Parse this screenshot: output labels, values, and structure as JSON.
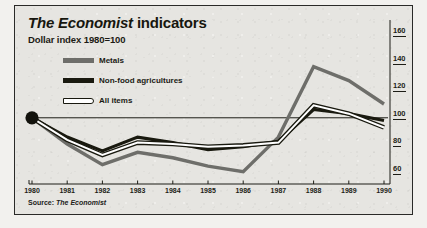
{
  "figure": {
    "title_brand": "The Economist",
    "title_rest": " indicators",
    "subtitle": "Dollar index 1980=100",
    "source_prefix": "Source: ",
    "source_brand": "The Economist"
  },
  "legend": {
    "position": "inside-top-left",
    "entries": [
      {
        "label": "Metals",
        "color": "#6e6e6a",
        "style": "solid-thick"
      },
      {
        "label": "Non-food agricultures",
        "color": "#19190f",
        "style": "solid-thick"
      },
      {
        "label": "All items",
        "color": "#ffffff",
        "style": "outlined"
      }
    ]
  },
  "colors": {
    "panel_background": "#e6e5e1",
    "panel_border": "#2a2a28",
    "metals": "#6e6e6a",
    "nonfood": "#19190f",
    "allitems_fill": "#ffffff",
    "allitems_stroke": "#19190f",
    "axis": "#1d1d16",
    "marker": "#12120c"
  },
  "chart_data": {
    "type": "line",
    "title": "The Economist indicators",
    "subtitle": "Dollar index 1980=100",
    "xlabel": "",
    "ylabel": "",
    "x": [
      1980,
      1981,
      1982,
      1983,
      1984,
      1985,
      1986,
      1987,
      1988,
      1989,
      1990
    ],
    "xticklabels": [
      "1980",
      "1981",
      "1982",
      "1983",
      "1984",
      "1985",
      "1986",
      "1987",
      "1988",
      "1989",
      "1990"
    ],
    "yticks": [
      60,
      80,
      100,
      120,
      140,
      160
    ],
    "yticklabels": [
      "60",
      "80",
      "100",
      "120",
      "140",
      "160"
    ],
    "ylim": [
      52,
      168
    ],
    "xlim": [
      1980,
      1990
    ],
    "grid": false,
    "baseline": 100,
    "series": [
      {
        "name": "Metals",
        "color": "#6e6e6a",
        "values": [
          100,
          81,
          66,
          75,
          71,
          65,
          61,
          86,
          137,
          127,
          110
        ]
      },
      {
        "name": "Non-food agricultures",
        "color": "#19190f",
        "values": [
          100,
          86,
          76,
          86,
          82,
          77,
          79,
          83,
          106,
          103,
          98
        ]
      },
      {
        "name": "All items",
        "color": "#ffffff",
        "values": [
          100,
          84,
          73,
          82,
          81,
          79,
          80,
          82,
          109,
          103,
          93
        ]
      }
    ],
    "annotations": [
      {
        "kind": "marker-dot",
        "x": 1980,
        "y": 100,
        "label": ""
      }
    ]
  }
}
